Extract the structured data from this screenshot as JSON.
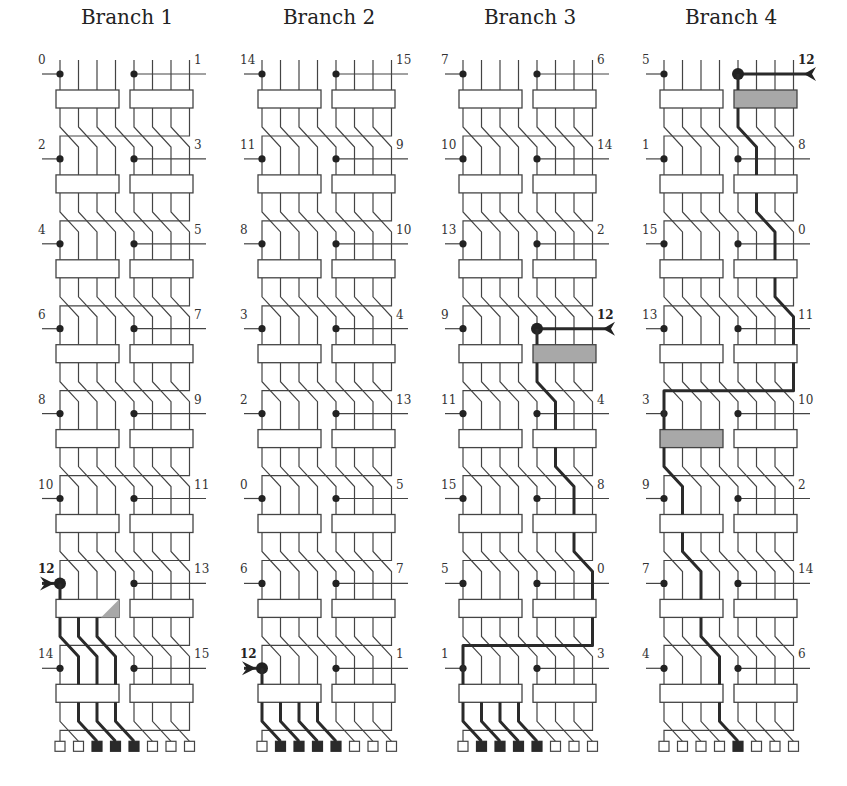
{
  "figure": {
    "branches": [
      {
        "title": "Branch 1",
        "left_labels": [
          "0",
          "2",
          "4",
          "6",
          "8",
          "10",
          "12",
          "14"
        ],
        "right_labels": [
          "1",
          "3",
          "5",
          "7",
          "9",
          "11",
          "13",
          "15"
        ],
        "inject": {
          "stage": 6,
          "side": "left",
          "label": "12"
        },
        "highlight_blocks": [],
        "partial_highlight_block": {
          "stage": 6,
          "side": "left"
        },
        "bold_segments": [
          {
            "from_stage": 6,
            "wires": [
              0,
              1,
              2
            ]
          },
          {
            "from_stage": 7,
            "wires": [
              1,
              2,
              3
            ]
          }
        ],
        "outputs_active": [
          2,
          3,
          4
        ]
      },
      {
        "title": "Branch 2",
        "left_labels": [
          "14",
          "11",
          "8",
          "3",
          "2",
          "0",
          "6",
          "12"
        ],
        "right_labels": [
          "15",
          "9",
          "10",
          "4",
          "13",
          "5",
          "7",
          "1"
        ],
        "inject": {
          "stage": 7,
          "side": "left",
          "label": "12"
        },
        "highlight_blocks": [],
        "bold_segments": [
          {
            "from_stage": 7,
            "wires": [
              0,
              1,
              2,
              3
            ]
          }
        ],
        "outputs_active": [
          1,
          2,
          3,
          4
        ]
      },
      {
        "title": "Branch 3",
        "left_labels": [
          "7",
          "10",
          "13",
          "9",
          "11",
          "15",
          "5",
          "1"
        ],
        "right_labels": [
          "6",
          "14",
          "2",
          "12",
          "4",
          "8",
          "0",
          "3"
        ],
        "inject": {
          "stage": 3,
          "side": "right",
          "label": "12"
        },
        "highlight_blocks": [
          {
            "stage": 3,
            "side": "right"
          }
        ],
        "bold_segments": [
          {
            "from_stage": 3,
            "wires": [
              4
            ]
          },
          {
            "from_stage": 4,
            "wires": [
              5
            ]
          },
          {
            "from_stage": 5,
            "wires": [
              6
            ]
          },
          {
            "from_stage": 6,
            "wires": [
              7
            ]
          },
          {
            "from_stage": 7,
            "wires": [
              0,
              1,
              2,
              3
            ]
          }
        ],
        "outputs_active": [
          1,
          2,
          3,
          4
        ]
      },
      {
        "title": "Branch 4",
        "left_labels": [
          "5",
          "1",
          "15",
          "13",
          "3",
          "9",
          "7",
          "4"
        ],
        "right_labels": [
          "12",
          "8",
          "0",
          "11",
          "10",
          "2",
          "14",
          "6"
        ],
        "inject": {
          "stage": 0,
          "side": "right",
          "label": "12"
        },
        "highlight_blocks": [
          {
            "stage": 0,
            "side": "right"
          },
          {
            "stage": 4,
            "side": "left"
          }
        ],
        "bold_segments": [
          {
            "from_stage": 0,
            "wires": [
              4
            ]
          },
          {
            "from_stage": 1,
            "wires": [
              5
            ]
          },
          {
            "from_stage": 2,
            "wires": [
              6
            ]
          },
          {
            "from_stage": 3,
            "wires": [
              7
            ]
          },
          {
            "from_stage": 4,
            "wires": [
              0
            ]
          },
          {
            "from_stage": 5,
            "wires": [
              1
            ]
          },
          {
            "from_stage": 6,
            "wires": [
              2
            ]
          },
          {
            "from_stage": 7,
            "wires": [
              3
            ]
          }
        ],
        "outputs_active": [
          4
        ]
      }
    ],
    "colors": {
      "line": "#444444",
      "highlight_path": "#2a2a2a",
      "highlight_block": "#a8a8a8",
      "background": "#ffffff"
    }
  }
}
